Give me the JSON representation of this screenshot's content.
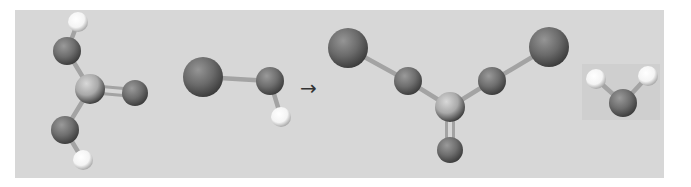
{
  "diagram": {
    "type": "ball-and-stick reaction scheme",
    "arrow_glyph": "→",
    "colors": {
      "page_bg": "#ffffff",
      "panel_bg": "#d7d7d7",
      "water_box": "#cfcfcf",
      "bond": "#a3a3a3",
      "oxygen": "#6e6e6e",
      "carbon": "#a9a9a9",
      "hydrogen": "#f4f4f4",
      "large_atom": "#6a6a6a",
      "arrow": "#333333"
    },
    "panel": {
      "x": 15,
      "y": 10,
      "w": 649,
      "h": 168
    },
    "water_box": {
      "x": 582,
      "y": 64,
      "w": 78,
      "h": 56
    },
    "arrow": {
      "x": 300,
      "y": 95,
      "label": "→"
    },
    "molecules": [
      {
        "name": "reactant-1-acid",
        "atoms": [
          {
            "id": "h1",
            "el": "H",
            "x": 78,
            "y": 22,
            "r": 10
          },
          {
            "id": "o1",
            "el": "O",
            "x": 67,
            "y": 51,
            "r": 14
          },
          {
            "id": "c1",
            "el": "C",
            "x": 90,
            "y": 89,
            "r": 15
          },
          {
            "id": "o2",
            "el": "O",
            "x": 135,
            "y": 93,
            "r": 13
          },
          {
            "id": "o3",
            "el": "O",
            "x": 65,
            "y": 130,
            "r": 14
          },
          {
            "id": "h2",
            "el": "H",
            "x": 83,
            "y": 160,
            "r": 10
          }
        ],
        "bonds": [
          {
            "a": "h1",
            "b": "o1",
            "order": 1
          },
          {
            "a": "o1",
            "b": "c1",
            "order": 1
          },
          {
            "a": "c1",
            "b": "o2",
            "order": 2
          },
          {
            "a": "c1",
            "b": "o3",
            "order": 1
          },
          {
            "a": "o3",
            "b": "h2",
            "order": 1
          }
        ]
      },
      {
        "name": "reactant-2",
        "atoms": [
          {
            "id": "x1",
            "el": "X",
            "x": 203,
            "y": 77,
            "r": 20
          },
          {
            "id": "o4",
            "el": "O",
            "x": 270,
            "y": 81,
            "r": 14
          },
          {
            "id": "h3",
            "el": "H",
            "x": 281,
            "y": 117,
            "r": 10
          }
        ],
        "bonds": [
          {
            "a": "x1",
            "b": "o4",
            "order": 1
          },
          {
            "a": "o4",
            "b": "h3",
            "order": 1
          }
        ]
      },
      {
        "name": "product-1",
        "atoms": [
          {
            "id": "x2",
            "el": "X",
            "x": 348,
            "y": 48,
            "r": 20
          },
          {
            "id": "o5",
            "el": "O",
            "x": 408,
            "y": 81,
            "r": 14
          },
          {
            "id": "c2",
            "el": "C",
            "x": 450,
            "y": 107,
            "r": 15
          },
          {
            "id": "o6",
            "el": "O",
            "x": 450,
            "y": 150,
            "r": 13
          },
          {
            "id": "o7",
            "el": "O",
            "x": 492,
            "y": 81,
            "r": 14
          },
          {
            "id": "x3",
            "el": "X",
            "x": 549,
            "y": 47,
            "r": 20
          }
        ],
        "bonds": [
          {
            "a": "x2",
            "b": "o5",
            "order": 1
          },
          {
            "a": "o5",
            "b": "c2",
            "order": 1
          },
          {
            "a": "c2",
            "b": "o6",
            "order": 2
          },
          {
            "a": "c2",
            "b": "o7",
            "order": 1
          },
          {
            "a": "o7",
            "b": "x3",
            "order": 1
          }
        ]
      },
      {
        "name": "product-2-water",
        "atoms": [
          {
            "id": "h4",
            "el": "H",
            "x": 596,
            "y": 79,
            "r": 10
          },
          {
            "id": "o8",
            "el": "O",
            "x": 623,
            "y": 103,
            "r": 14
          },
          {
            "id": "h5",
            "el": "H",
            "x": 648,
            "y": 76,
            "r": 10
          }
        ],
        "bonds": [
          {
            "a": "h4",
            "b": "o8",
            "order": 1
          },
          {
            "a": "o8",
            "b": "h5",
            "order": 1
          }
        ]
      }
    ]
  }
}
